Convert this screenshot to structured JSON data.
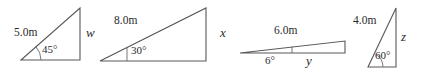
{
  "figure": {
    "stroke_color": "#585858",
    "text_color": "#2b2b2b",
    "background": "#ffffff",
    "width": 426,
    "height": 73
  },
  "triangles": [
    {
      "id": "triangle-1",
      "hypotenuse_label": "5.0m",
      "angle_label": "45°",
      "unknown_side_label": "w",
      "angle_degrees": 45,
      "known_side_meters": 5.0,
      "orientation": "right-angle-at-bottom-right"
    },
    {
      "id": "triangle-2",
      "hypotenuse_label": "8.0m",
      "angle_label": "30°",
      "unknown_side_label": "x",
      "angle_degrees": 30,
      "known_side_meters": 8.0,
      "orientation": "right-angle-at-bottom-right"
    },
    {
      "id": "triangle-3",
      "hypotenuse_label": "6.0m",
      "angle_label": "6°",
      "unknown_side_label": "y",
      "angle_degrees": 6,
      "known_side_meters": 6.0,
      "orientation": "right-angle-at-bottom-right"
    },
    {
      "id": "triangle-4",
      "hypotenuse_label": "4.0m",
      "angle_label": "60°",
      "unknown_side_label": "z",
      "angle_degrees": 60,
      "known_side_meters": 4.0,
      "orientation": "right-angle-at-bottom-right"
    }
  ]
}
